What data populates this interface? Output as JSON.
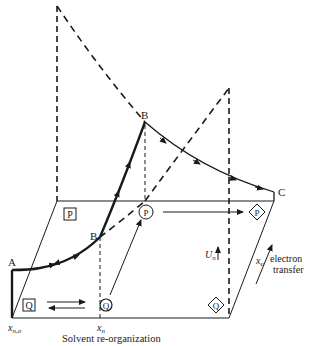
{
  "diagram": {
    "points": {
      "A": "A",
      "B_upper": "B",
      "B_lower": "B",
      "C": "C"
    },
    "states": {
      "P_square": "P",
      "Q_square": "Q",
      "P_circle": "P",
      "Q_circle": "Q",
      "P_diamond": "P",
      "Q_diamond": "Q"
    },
    "axes": {
      "x_n0": "x",
      "x_n0_sub": "n,o",
      "x_n": "x",
      "x_n_sub": "n",
      "x_e": "x",
      "x_e_sub": "e",
      "U_n": "U",
      "U_n_sub": "n",
      "solvent_label": "Solvent re-organization",
      "electron_label_1": "electron",
      "electron_label_2": "transfer"
    },
    "colors": {
      "ink": "#1a1a1a",
      "background": "#ffffff"
    }
  }
}
